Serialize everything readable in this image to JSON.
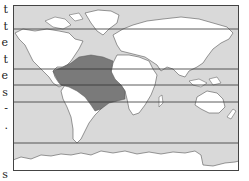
{
  "left_text_fragments": [
    "t",
    "t",
    "e",
    "t",
    "e",
    "s",
    "-",
    ".",
    "",
    "",
    "s"
  ],
  "map": {
    "type": "world-distribution-map",
    "colors": {
      "ocean": "#d9d9d9",
      "land": "#ffffff",
      "highlight": "#7a7a7a",
      "coastline": "#555555",
      "frame": "#444444",
      "latitude_lines": "#333333"
    },
    "highlighted_region": "Gulf of Mexico, Caribbean, tropical Atlantic and northern South America",
    "latitude_lines_y": [
      24,
      64,
      80,
      97,
      138
    ]
  }
}
